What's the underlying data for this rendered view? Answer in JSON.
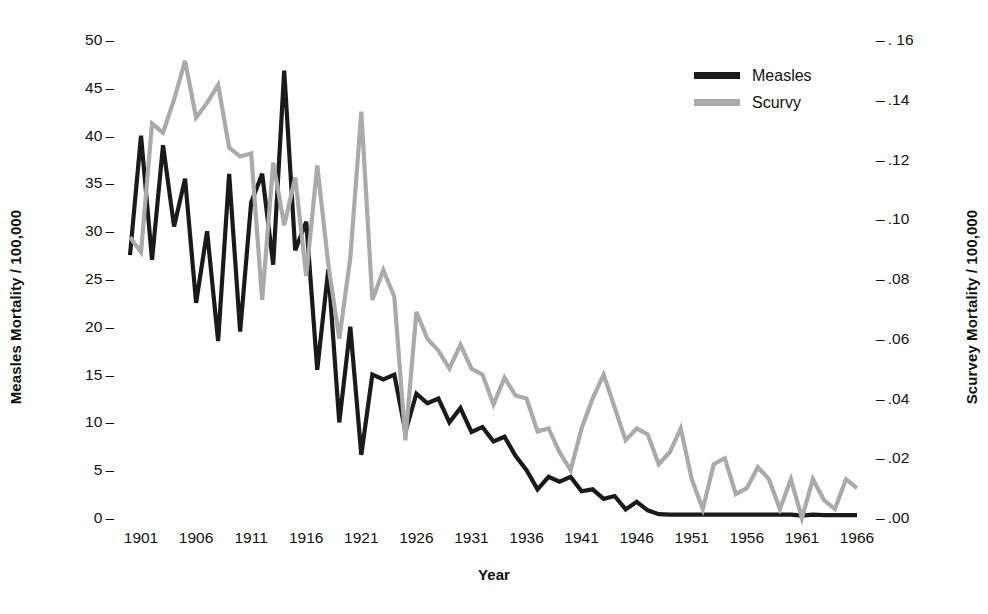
{
  "chart_data": {
    "type": "line",
    "title": "",
    "xlabel": "Year",
    "ylabel": "Measles Mortality / 100,000",
    "ylabel_right": "Scurvey Mortality / 100,000",
    "xlim": [
      1900,
      1967
    ],
    "ylim": [
      0,
      50
    ],
    "ylim_right": [
      0.0,
      0.16
    ],
    "grid": false,
    "legend_position": "top-right",
    "xticks": [
      1901,
      1906,
      1911,
      1916,
      1921,
      1926,
      1931,
      1936,
      1941,
      1946,
      1951,
      1956,
      1961,
      1966
    ],
    "xtick_labels": [
      "1901",
      "1906",
      "1911",
      "1916",
      "1921",
      "1926",
      "1931",
      "1936",
      "1941",
      "1946",
      "1951",
      "1956",
      "1961",
      "1966"
    ],
    "yticks_left": [
      0,
      5,
      10,
      15,
      20,
      25,
      30,
      35,
      40,
      45,
      50
    ],
    "ytick_labels_left": [
      "0",
      "5",
      "10",
      "15",
      "20",
      "25",
      "30",
      "35",
      "40",
      "45",
      "50"
    ],
    "yticks_right": [
      0.0,
      0.02,
      0.04,
      0.06,
      0.08,
      0.1,
      0.12,
      0.14,
      0.16
    ],
    "ytick_labels_right": [
      ".00",
      ".02",
      ".04",
      ".06",
      ".08",
      ".10",
      ".12",
      ".14",
      ". 16"
    ],
    "tick_dash": "–",
    "x": [
      1900,
      1901,
      1902,
      1903,
      1904,
      1905,
      1906,
      1907,
      1908,
      1909,
      1910,
      1911,
      1912,
      1913,
      1914,
      1915,
      1916,
      1917,
      1918,
      1919,
      1920,
      1921,
      1922,
      1923,
      1924,
      1925,
      1926,
      1927,
      1928,
      1929,
      1930,
      1931,
      1932,
      1933,
      1934,
      1935,
      1936,
      1937,
      1938,
      1939,
      1940,
      1941,
      1942,
      1943,
      1944,
      1945,
      1946,
      1947,
      1948,
      1949,
      1950,
      1951,
      1952,
      1953,
      1954,
      1955,
      1956,
      1957,
      1958,
      1959,
      1960,
      1961,
      1962,
      1963,
      1964,
      1965,
      1966
    ],
    "series": [
      {
        "name": "Measles",
        "axis": "left",
        "color": "#1a1a1a",
        "linewidth": 4.2,
        "values": [
          27.5,
          40.0,
          27.0,
          39.0,
          30.5,
          35.5,
          22.5,
          30.0,
          18.5,
          36.0,
          19.5,
          33.0,
          36.0,
          26.5,
          46.8,
          28.0,
          31.0,
          15.5,
          26.0,
          10.0,
          20.0,
          6.6,
          15.0,
          14.5,
          15.0,
          9.0,
          13.0,
          12.0,
          12.5,
          10.0,
          11.5,
          9.0,
          9.5,
          8.0,
          8.5,
          6.5,
          5.0,
          3.0,
          4.3,
          3.8,
          4.3,
          2.8,
          3.0,
          2.0,
          2.3,
          0.9,
          1.7,
          0.8,
          0.4,
          0.35,
          0.35,
          0.35,
          0.35,
          0.35,
          0.35,
          0.35,
          0.35,
          0.35,
          0.35,
          0.35,
          0.35,
          0.25,
          0.35,
          0.3,
          0.3,
          0.3,
          0.3
        ]
      },
      {
        "name": "Scurvy",
        "axis": "right",
        "color": "#aaaaaa",
        "linewidth": 4.2,
        "values": [
          0.094,
          0.089,
          0.132,
          0.129,
          0.14,
          0.153,
          0.134,
          0.139,
          0.145,
          0.124,
          0.121,
          0.122,
          0.073,
          0.119,
          0.098,
          0.114,
          0.081,
          0.118,
          0.085,
          0.06,
          0.087,
          0.136,
          0.073,
          0.083,
          0.074,
          0.026,
          0.069,
          0.06,
          0.056,
          0.05,
          0.058,
          0.05,
          0.048,
          0.038,
          0.047,
          0.041,
          0.04,
          0.029,
          0.03,
          0.022,
          0.016,
          0.03,
          0.04,
          0.048,
          0.037,
          0.026,
          0.03,
          0.028,
          0.018,
          0.022,
          0.03,
          0.013,
          0.003,
          0.018,
          0.02,
          0.008,
          0.01,
          0.017,
          0.013,
          0.003,
          0.013,
          0.0,
          0.013,
          0.006,
          0.003,
          0.013,
          0.01
        ]
      }
    ]
  },
  "legend": {
    "entries": [
      {
        "label": "Measles",
        "color": "#1a1a1a"
      },
      {
        "label": "Scurvy",
        "color": "#aaaaaa"
      }
    ]
  },
  "axis_titles": {
    "left": "Measles Mortality / 100,000",
    "right": "Scurvey Mortality / 100,000",
    "bottom": "Year"
  }
}
